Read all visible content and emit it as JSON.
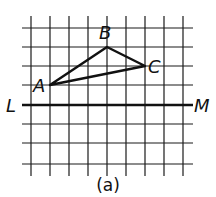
{
  "figure": {
    "caption": "(a)",
    "grid": {
      "columns_x": [
        31,
        50,
        69,
        88,
        107,
        126,
        145,
        164,
        183
      ],
      "rows_y": [
        28,
        47,
        66,
        85,
        124,
        143,
        164
      ],
      "h_extent": [
        22,
        193
      ],
      "v_extent": [
        16,
        176
      ]
    },
    "line_LM": {
      "y": 105,
      "x1": 22,
      "x2": 193,
      "left_label": "L",
      "right_label": "M"
    },
    "triangle": {
      "points": {
        "A": {
          "x": 50,
          "y": 85,
          "label": "A"
        },
        "B": {
          "x": 107,
          "y": 47,
          "label": "B"
        },
        "C": {
          "x": 145,
          "y": 66,
          "label": "C"
        }
      }
    }
  }
}
